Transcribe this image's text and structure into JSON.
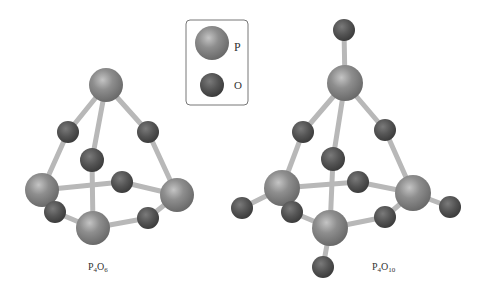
{
  "legend": {
    "items": [
      {
        "symbol": "P",
        "label": "P",
        "element": "phosphorus",
        "color": "#8c8c8c"
      },
      {
        "symbol": "O",
        "label": "O",
        "element": "oxygen",
        "color": "#555555"
      }
    ]
  },
  "molecules": [
    {
      "name": "P4O6",
      "label_main": "P",
      "sub1": "4",
      "label_o": "O",
      "sub2": "6"
    },
    {
      "name": "P4O10",
      "label_main": "P",
      "sub1": "4",
      "label_o": "O",
      "sub2": "10"
    }
  ],
  "colors": {
    "phosphorus": "#8c8c8c",
    "oxygen": "#555555",
    "bond": "#c8c8c8",
    "legend_border": "#777777"
  }
}
